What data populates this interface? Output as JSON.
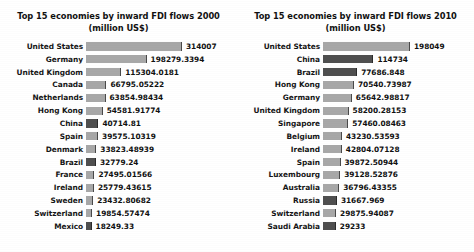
{
  "charts": [
    {
      "title_line1": "Top 15 economies by inward FDI flows 2000",
      "title_line2": "(million US$)"
    },
    {
      "title_line1": "Top 15 economies by inward FDI flows 2010",
      "title_line2": "(million US$)"
    }
  ],
  "chart_data": [
    {
      "type": "bar",
      "title": "Top 15 economies by inward FDI flows 2000 (million US$)",
      "orientation": "horizontal",
      "xlabel": "",
      "ylabel": "",
      "grid": false,
      "legend": "none",
      "xlim": [
        0,
        314007
      ],
      "categories": [
        "United States",
        "Germany",
        "United Kingdom",
        "Canada",
        "Netherlands",
        "Hong Kong",
        "China",
        "Spain",
        "Denmark",
        "Brazil",
        "France",
        "Ireland",
        "Sweden",
        "Switzerland",
        "Mexico"
      ],
      "values": [
        314007,
        198279.3394,
        115304.0181,
        66795.05222,
        63854.98434,
        54581.91774,
        40714.81,
        39575.10319,
        33823.48939,
        32779.24,
        27495.01566,
        25779.43615,
        23432.80682,
        19854.57474,
        18249.33
      ],
      "value_labels": [
        "314007",
        "198279.3394",
        "115304.0181",
        "66795.05222",
        "63854.98434",
        "54581.91774",
        "40714.81",
        "39575.10319",
        "33823.48939",
        "32779.24",
        "27495.01566",
        "25779.43615",
        "23432.80682",
        "19854.57474",
        "18249.33"
      ],
      "highlighted": [
        false,
        false,
        false,
        false,
        false,
        false,
        true,
        false,
        false,
        true,
        false,
        false,
        false,
        false,
        true
      ],
      "colors": {
        "bar": "#a8a8a8",
        "bar_highlight": "#4f4f4f",
        "bar_edge": "#4a4a4a"
      }
    },
    {
      "type": "bar",
      "title": "Top 15 economies by inward FDI flows 2010 (million US$)",
      "orientation": "horizontal",
      "xlabel": "",
      "ylabel": "",
      "grid": false,
      "legend": "none",
      "xlim": [
        0,
        198049
      ],
      "categories": [
        "United States",
        "China",
        "Brazil",
        "Hong Kong",
        "Germany",
        "United Kingdom",
        "Singapore",
        "Belgium",
        "Ireland",
        "Spain",
        "Luxembourg",
        "Australia",
        "Russia",
        "Switzerland",
        "Saudi Arabia"
      ],
      "values": [
        198049,
        114734,
        77686.848,
        70540.73987,
        65642.98817,
        58200.28153,
        57460.08463,
        43230.53593,
        42804.07128,
        39872.50944,
        39128.52876,
        36796.43355,
        31667.969,
        29875.94087,
        29233
      ],
      "value_labels": [
        "198049",
        "114734",
        "77686.848",
        "70540.73987",
        "65642.98817",
        "58200.28153",
        "57460.08463",
        "43230.53593",
        "42804.07128",
        "39872.50944",
        "39128.52876",
        "36796.43355",
        "31667.969",
        "29875.94087",
        "29233"
      ],
      "highlighted": [
        false,
        true,
        true,
        false,
        false,
        false,
        false,
        false,
        false,
        false,
        false,
        false,
        true,
        false,
        true
      ],
      "colors": {
        "bar": "#a8a8a8",
        "bar_highlight": "#4f4f4f",
        "bar_edge": "#4a4a4a"
      }
    }
  ]
}
